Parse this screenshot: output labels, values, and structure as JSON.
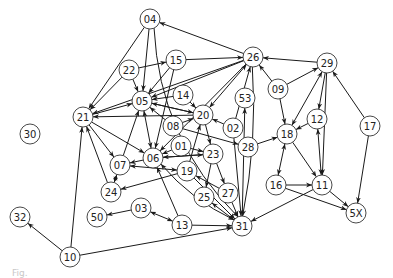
{
  "diagram": {
    "type": "directed-graph",
    "node_radius": 10,
    "colors": {
      "edge": "#1a1a1a",
      "node_stroke": "#333333",
      "node_fill": "#ffffff",
      "label": "#222222"
    },
    "nodes": [
      {
        "id": "04",
        "x": 150,
        "y": 19
      },
      {
        "id": "26",
        "x": 253,
        "y": 57
      },
      {
        "id": "29",
        "x": 327,
        "y": 63
      },
      {
        "id": "15",
        "x": 176,
        "y": 60
      },
      {
        "id": "22",
        "x": 129,
        "y": 70
      },
      {
        "id": "05",
        "x": 142,
        "y": 101
      },
      {
        "id": "14",
        "x": 183,
        "y": 95
      },
      {
        "id": "09",
        "x": 278,
        "y": 89
      },
      {
        "id": "53",
        "x": 245,
        "y": 98
      },
      {
        "id": "20",
        "x": 203,
        "y": 115
      },
      {
        "id": "21",
        "x": 83,
        "y": 117
      },
      {
        "id": "08",
        "x": 173,
        "y": 126
      },
      {
        "id": "02",
        "x": 233,
        "y": 128
      },
      {
        "id": "12",
        "x": 317,
        "y": 119
      },
      {
        "id": "17",
        "x": 370,
        "y": 126
      },
      {
        "id": "18",
        "x": 287,
        "y": 134
      },
      {
        "id": "28",
        "x": 248,
        "y": 147
      },
      {
        "id": "01",
        "x": 181,
        "y": 146
      },
      {
        "id": "30",
        "x": 30,
        "y": 134
      },
      {
        "id": "06",
        "x": 153,
        "y": 158
      },
      {
        "id": "23",
        "x": 213,
        "y": 154
      },
      {
        "id": "07",
        "x": 120,
        "y": 165
      },
      {
        "id": "19",
        "x": 187,
        "y": 171
      },
      {
        "id": "24",
        "x": 111,
        "y": 192
      },
      {
        "id": "25",
        "x": 204,
        "y": 197
      },
      {
        "id": "27",
        "x": 228,
        "y": 193
      },
      {
        "id": "16",
        "x": 276,
        "y": 185
      },
      {
        "id": "11",
        "x": 322,
        "y": 185
      },
      {
        "id": "5X",
        "x": 356,
        "y": 213
      },
      {
        "id": "03",
        "x": 141,
        "y": 208
      },
      {
        "id": "50",
        "x": 97,
        "y": 217
      },
      {
        "id": "13",
        "x": 182,
        "y": 225
      },
      {
        "id": "31",
        "x": 242,
        "y": 226
      },
      {
        "id": "32",
        "x": 20,
        "y": 217
      },
      {
        "id": "10",
        "x": 70,
        "y": 257
      }
    ],
    "edges": [
      {
        "from": "04",
        "to": "21"
      },
      {
        "from": "04",
        "to": "05"
      },
      {
        "from": "04",
        "to": "31",
        "curve": 40
      },
      {
        "from": "26",
        "to": "04"
      },
      {
        "from": "22",
        "to": "15"
      },
      {
        "from": "22",
        "to": "05"
      },
      {
        "from": "22",
        "to": "21"
      },
      {
        "from": "15",
        "to": "26"
      },
      {
        "from": "15",
        "to": "05"
      },
      {
        "from": "15",
        "to": "06"
      },
      {
        "from": "26",
        "to": "05"
      },
      {
        "from": "26",
        "to": "20",
        "both": true
      },
      {
        "from": "26",
        "to": "21"
      },
      {
        "from": "26",
        "to": "06"
      },
      {
        "from": "02",
        "to": "26"
      },
      {
        "from": "29",
        "to": "26"
      },
      {
        "from": "09",
        "to": "26"
      },
      {
        "from": "09",
        "to": "29"
      },
      {
        "from": "09",
        "to": "18"
      },
      {
        "from": "29",
        "to": "18",
        "both": true
      },
      {
        "from": "29",
        "to": "12"
      },
      {
        "from": "29",
        "to": "11"
      },
      {
        "from": "17",
        "to": "29"
      },
      {
        "from": "17",
        "to": "5X"
      },
      {
        "from": "12",
        "to": "18"
      },
      {
        "from": "12",
        "to": "11",
        "both": true
      },
      {
        "from": "18",
        "to": "16",
        "both": true
      },
      {
        "from": "18",
        "to": "11"
      },
      {
        "from": "16",
        "to": "11"
      },
      {
        "from": "16",
        "to": "5X"
      },
      {
        "from": "11",
        "to": "5X"
      },
      {
        "from": "11",
        "to": "31"
      },
      {
        "from": "28",
        "to": "18"
      },
      {
        "from": "53",
        "to": "31",
        "reverse_arrow": true
      },
      {
        "from": "26",
        "to": "31",
        "curve": -10
      },
      {
        "from": "14",
        "to": "05"
      },
      {
        "from": "14",
        "to": "20"
      },
      {
        "from": "05",
        "to": "20"
      },
      {
        "from": "20",
        "to": "05"
      },
      {
        "from": "21",
        "to": "05"
      },
      {
        "from": "20",
        "to": "21"
      },
      {
        "from": "08",
        "to": "05"
      },
      {
        "from": "08",
        "to": "20"
      },
      {
        "from": "08",
        "to": "28"
      },
      {
        "from": "02",
        "to": "20"
      },
      {
        "from": "02",
        "to": "31"
      },
      {
        "from": "05",
        "to": "06",
        "both": true
      },
      {
        "from": "07",
        "to": "05"
      },
      {
        "from": "21",
        "to": "06"
      },
      {
        "from": "21",
        "to": "07"
      },
      {
        "from": "24",
        "to": "21"
      },
      {
        "from": "10",
        "to": "21"
      },
      {
        "from": "10",
        "to": "32"
      },
      {
        "from": "10",
        "to": "31"
      },
      {
        "from": "01",
        "to": "06"
      },
      {
        "from": "01",
        "to": "23"
      },
      {
        "from": "20",
        "to": "23"
      },
      {
        "from": "23",
        "to": "06"
      },
      {
        "from": "06",
        "to": "23"
      },
      {
        "from": "19",
        "to": "20"
      },
      {
        "from": "06",
        "to": "07"
      },
      {
        "from": "07",
        "to": "19",
        "both": true
      },
      {
        "from": "07",
        "to": "24",
        "both": true
      },
      {
        "from": "19",
        "to": "24"
      },
      {
        "from": "23",
        "to": "25"
      },
      {
        "from": "23",
        "to": "27"
      },
      {
        "from": "27",
        "to": "19"
      },
      {
        "from": "25",
        "to": "31",
        "both": true
      },
      {
        "from": "27",
        "to": "31"
      },
      {
        "from": "19",
        "to": "31"
      },
      {
        "from": "06",
        "to": "31",
        "both": true,
        "curve": 10
      },
      {
        "from": "13",
        "to": "06"
      },
      {
        "from": "13",
        "to": "31"
      },
      {
        "from": "03",
        "to": "13",
        "both": true
      },
      {
        "from": "03",
        "to": "50"
      }
    ]
  },
  "caption": {
    "text": "Fig."
  }
}
